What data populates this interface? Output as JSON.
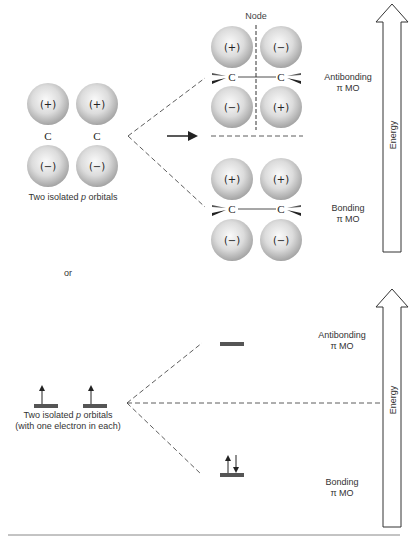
{
  "top_panel": {
    "left_label": "Two isolated p orbitals",
    "left_label_parts": [
      "Two isolated ",
      "p",
      " orbitals"
    ],
    "left_orbitals": {
      "top_signs": [
        "(+)",
        "(+)"
      ],
      "atoms": [
        "C",
        "C"
      ],
      "bottom_signs": [
        "(−)",
        "(−)"
      ]
    },
    "node_label": "Node",
    "antibonding": {
      "signs_top": [
        "(+)",
        "(−)"
      ],
      "signs_bottom": [
        "(−)",
        "(+)"
      ],
      "label_line1": "Antibonding",
      "label_line2": "π MO"
    },
    "bonding": {
      "signs_top": [
        "(+)",
        "(+)"
      ],
      "signs_bottom": [
        "(−)",
        "(−)"
      ],
      "label_line1": "Bonding",
      "label_line2": "π MO"
    },
    "energy_label": "Energy"
  },
  "separator_text": "or",
  "bottom_panel": {
    "left_label_line1_parts": [
      "Two isolated ",
      "p",
      " orbitals"
    ],
    "left_label_line2": "(with one electron in each)",
    "antibonding": {
      "label_line1": "Antibonding",
      "label_line2": "π MO"
    },
    "bonding": {
      "label_line1": "Bonding",
      "label_line2": "π MO"
    },
    "energy_label": "Energy"
  },
  "colors": {
    "line": "#333333",
    "level_bar": "#555555",
    "sphere_light": "#f4f4f4",
    "sphere_dark": "#a8a8a8"
  }
}
